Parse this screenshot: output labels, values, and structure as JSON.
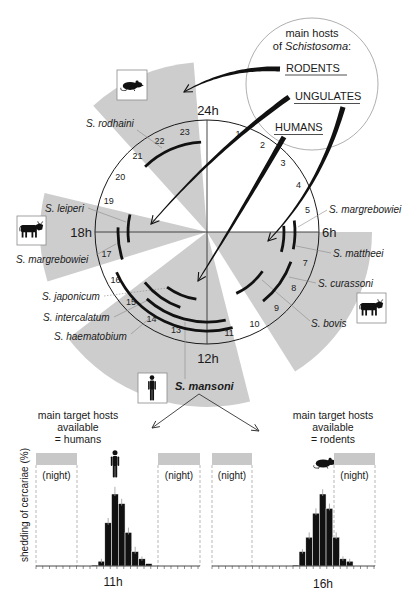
{
  "figure": {
    "host_legend": {
      "title_line1": "main hosts",
      "title_line2_prefix": "of ",
      "title_line2_genus": "Schistosoma",
      "title_line2_suffix": ":",
      "hosts": [
        "RODENTS",
        "UNGULATES",
        "HUMANS"
      ]
    },
    "clock": {
      "cardinal_labels": {
        "top": "24h",
        "right": "6h",
        "bottom": "12h",
        "left": "18h"
      },
      "hour_numbers": [
        1,
        2,
        3,
        4,
        5,
        7,
        8,
        9,
        10,
        11,
        13,
        14,
        15,
        16,
        17,
        19,
        20,
        21,
        22,
        23
      ],
      "host_sectors": [
        {
          "host": "rodents",
          "icon": "rat-icon",
          "from_h": 21.2,
          "to_h": 23.7,
          "radius": 170
        },
        {
          "host": "ungulates",
          "icon": "cow-icon",
          "from_h": 16.85,
          "to_h": 18.9,
          "radius": 167
        },
        {
          "host": "humans",
          "icon": "human-icon",
          "from_h": 11.05,
          "to_h": 15.5,
          "radius": 175
        },
        {
          "host": "ungulates",
          "icon": "cow-icon",
          "from_h": 6.0,
          "to_h": 9.85,
          "radius": 165
        }
      ],
      "host_arrows": [
        {
          "from": "RODENTS",
          "to_sector": 0
        },
        {
          "from": "UNGULATES",
          "to_sector": 1
        },
        {
          "from": "HUMANS",
          "to_sector": 2
        },
        {
          "from": "UNGULATES",
          "to_sector": 3
        }
      ]
    },
    "species": [
      {
        "name": "S. rodhaini",
        "from_h": 21.1,
        "to_h": 23.75,
        "ring": 90
      },
      {
        "name": "S. leiperi",
        "from_h": 17.5,
        "to_h": 18.85,
        "ring": 79
      },
      {
        "name": "S. margrebowiei",
        "from_h": 16.8,
        "to_h": 18.2,
        "ring": 89
      },
      {
        "name": "S. japonicum",
        "from_h": 12.6,
        "to_h": 14.4,
        "ring": 68
      },
      {
        "name": "S. intercalatum",
        "from_h": 13.3,
        "to_h": 15.4,
        "ring": 80
      },
      {
        "name": "S. haematobium",
        "from_h": 11.2,
        "to_h": 14.8,
        "ring": 90
      },
      {
        "name": "S. mansoni",
        "from_h": 11.0,
        "to_h": 16.4,
        "ring": 99
      },
      {
        "name": "S. margrebowiei",
        "from_h": 5.5,
        "to_h": 6.75,
        "ring": 88
      },
      {
        "name": "S. mattheei",
        "from_h": 5.7,
        "to_h": 7.0,
        "ring": 77
      },
      {
        "name": "S. curassoni",
        "from_h": 7.3,
        "to_h": 9.4,
        "ring": 89
      },
      {
        "name": "S. bovis",
        "from_h": 8.35,
        "to_h": 10.3,
        "ring": 68
      }
    ],
    "panels": [
      {
        "title": [
          "main target hosts",
          "available",
          "= humans"
        ],
        "night_label": "(night)",
        "peak_label": "11h",
        "host_icon": "human-icon"
      },
      {
        "title": [
          "main target hosts",
          "available",
          "= rodents"
        ],
        "night_label": "(night)",
        "peak_label": "16h",
        "host_icon": "rat-icon"
      }
    ],
    "y_axis_label": "shedding of cercariae (%)"
  },
  "colors": {
    "sector_gray": "#cdcdcd",
    "night_gray": "#c8c8c8",
    "ink": "#111111",
    "leader_gray": "#8a8a8a"
  },
  "chart_data": [
    {
      "type": "bar",
      "title": "main target hosts available = humans",
      "species": "S. mansoni",
      "xlabel": "11h",
      "ylabel": "shedding of cercariae (%)",
      "peak_time": "11h",
      "values": [
        0.4,
        2,
        18,
        30,
        26,
        14,
        6,
        3,
        1
      ],
      "errors": [
        0,
        1,
        2,
        3,
        2,
        2,
        2,
        1,
        0
      ],
      "shaded_regions": [
        "(night)",
        "(night)"
      ],
      "grid": false,
      "y_ticks_labeled": false
    },
    {
      "type": "bar",
      "title": "main target hosts available = rodents",
      "species": "S. mansoni",
      "xlabel": "16h",
      "ylabel": "shedding of cercariae (%)",
      "peak_time": "16h",
      "values": [
        0.4,
        6,
        12,
        22,
        30,
        24,
        12,
        3,
        2
      ],
      "errors": [
        0,
        1,
        2,
        2,
        2,
        2,
        2,
        1,
        1
      ],
      "shaded_regions": [
        "(night)",
        "(night)"
      ],
      "grid": false,
      "y_ticks_labeled": false
    }
  ]
}
